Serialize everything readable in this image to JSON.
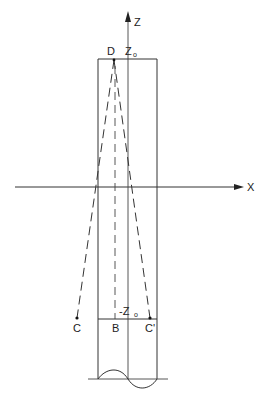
{
  "figure": {
    "axes": {
      "x_label": "X",
      "z_label": "Z"
    },
    "points": {
      "D": "D",
      "C": "C",
      "B": "B",
      "C_prime": "C'"
    },
    "markers": {
      "z0_top": "Z",
      "z0_top_sub": "o",
      "z0_bottom_prefix": "-Z",
      "z0_bottom_sub": "o"
    },
    "colors": {
      "line": "#333333",
      "background": "#ffffff"
    }
  }
}
